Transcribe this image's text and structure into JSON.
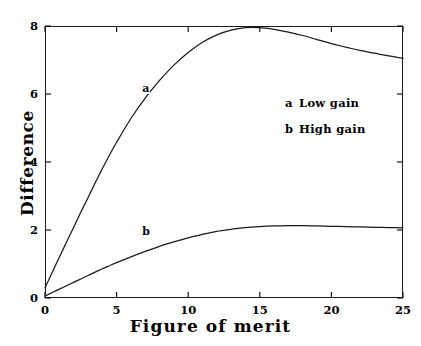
{
  "chart_data": {
    "type": "line",
    "title": "",
    "xlabel": "Figure of merit",
    "ylabel": "Difference",
    "xlim": [
      0,
      25
    ],
    "ylim": [
      0,
      8
    ],
    "xticks": [
      0,
      5,
      10,
      15,
      20,
      25
    ],
    "yticks": [
      0,
      2,
      4,
      6,
      8
    ],
    "xtick_labels": [
      "0",
      "5",
      "10",
      "15",
      "20",
      "25"
    ],
    "ytick_labels": [
      "0",
      "2",
      "4",
      "6",
      "8"
    ],
    "grid": false,
    "frame": true,
    "legend_position": "upper right inside",
    "series": [
      {
        "name": "Low gain",
        "key": "a",
        "inline_label": "a",
        "inline_label_x": 7.0,
        "inline_label_y": 6.15,
        "x": [
          0.0,
          0.5,
          1.0,
          1.5,
          2.0,
          2.5,
          3.0,
          3.5,
          4.0,
          4.5,
          5.0,
          6.0,
          7.0,
          8.0,
          9.0,
          10.0,
          11.0,
          12.0,
          13.0,
          14.0,
          15.0,
          16.0,
          17.0,
          18.0,
          19.0,
          20.0,
          21.0,
          22.0,
          23.0,
          24.0,
          25.0
        ],
        "y": [
          0.3,
          0.75,
          1.2,
          1.64,
          2.08,
          2.52,
          2.95,
          3.38,
          3.8,
          4.2,
          4.58,
          5.28,
          5.88,
          6.4,
          6.85,
          7.22,
          7.52,
          7.74,
          7.88,
          7.95,
          7.95,
          7.9,
          7.82,
          7.72,
          7.6,
          7.48,
          7.38,
          7.28,
          7.2,
          7.12,
          7.05
        ]
      },
      {
        "name": "High gain",
        "key": "b",
        "inline_label": "b",
        "inline_label_x": 7.0,
        "inline_label_y": 1.93,
        "x": [
          0.0,
          0.5,
          1.0,
          1.5,
          2.0,
          2.5,
          3.0,
          3.5,
          4.0,
          4.5,
          5.0,
          6.0,
          7.0,
          8.0,
          9.0,
          10.0,
          11.0,
          12.0,
          13.0,
          14.0,
          15.0,
          16.0,
          17.0,
          18.0,
          19.0,
          20.0,
          21.0,
          22.0,
          23.0,
          24.0,
          25.0
        ],
        "y": [
          0.06,
          0.16,
          0.26,
          0.36,
          0.46,
          0.56,
          0.66,
          0.76,
          0.86,
          0.95,
          1.04,
          1.21,
          1.37,
          1.52,
          1.65,
          1.77,
          1.87,
          1.96,
          2.02,
          2.07,
          2.1,
          2.12,
          2.13,
          2.13,
          2.12,
          2.11,
          2.1,
          2.09,
          2.08,
          2.07,
          2.06
        ]
      }
    ],
    "colors": {
      "line": "#1a1a1a",
      "axis": "#1a1a1a",
      "background": "#ffffff"
    }
  },
  "legend": {
    "entries": [
      {
        "key": "a",
        "label": "Low gain"
      },
      {
        "key": "b",
        "label": "High gain"
      }
    ]
  },
  "axes": {
    "x_title": "Figure of merit",
    "y_title": "Difference"
  }
}
